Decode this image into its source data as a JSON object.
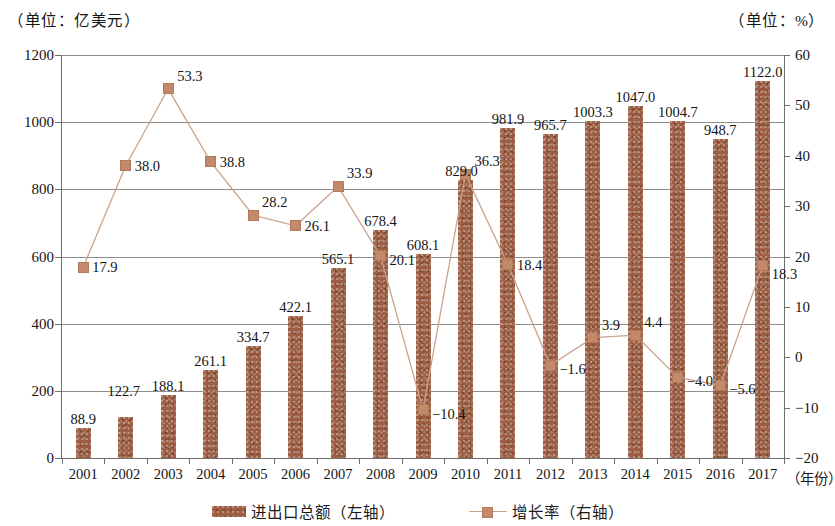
{
  "header": {
    "unit_left": "（单位：亿美元）",
    "unit_right": "（单位：%）"
  },
  "axes": {
    "x_axis_title": "（年份）",
    "y_left_ticks": [
      "0",
      "200",
      "400",
      "600",
      "800",
      "1000",
      "1200"
    ],
    "y_right_ticks": [
      "-20",
      "-10",
      "0",
      "10",
      "20",
      "30",
      "40",
      "50",
      "60"
    ]
  },
  "legend": {
    "bar_label": "进出口总额（左轴）",
    "line_label": "增长率（右轴）"
  },
  "colors": {
    "bar": "#9d5f43",
    "line": "#c9a38c",
    "marker": "#c4886a",
    "grid": "#8d8d8d",
    "axis": "#6e6e6e",
    "text": "#141414",
    "background": "#ffffff"
  },
  "chart_data": {
    "type": "bar",
    "title": "",
    "subtitle": "",
    "xlabel": "（年份）",
    "ylabel": "（单位：亿美元）",
    "y2label": "（单位：%）",
    "ylim": [
      0,
      1200
    ],
    "y2lim": [
      -20,
      60
    ],
    "grid": true,
    "legend_position": "bottom",
    "categories": [
      "2001",
      "2002",
      "2003",
      "2004",
      "2005",
      "2006",
      "2007",
      "2008",
      "2009",
      "2010",
      "2011",
      "2012",
      "2013",
      "2014",
      "2015",
      "2016",
      "2017"
    ],
    "series": [
      {
        "name": "进出口总额（左轴）",
        "type": "bar",
        "axis": "left",
        "unit": "亿美元",
        "values": [
          88.9,
          122.7,
          188.1,
          261.1,
          334.7,
          422.1,
          565.1,
          678.4,
          608.1,
          829.0,
          981.9,
          965.7,
          1003.3,
          1047.0,
          1004.7,
          948.7,
          1122.0
        ],
        "labels": [
          "88.9",
          "122.7",
          "188.1",
          "261.1",
          "334.7",
          "422.1",
          "565.1",
          "678.4",
          "608.1",
          "829.0",
          "981.9",
          "965.7",
          "1003.3",
          "1047.0",
          "1004.7",
          "948.7",
          "1122.0"
        ]
      },
      {
        "name": "增长率（右轴）",
        "type": "line",
        "axis": "right",
        "unit": "%",
        "values": [
          17.9,
          38.0,
          53.3,
          38.8,
          28.2,
          26.1,
          33.9,
          20.1,
          -10.4,
          36.3,
          18.4,
          -1.6,
          3.9,
          4.4,
          -4.0,
          -5.6,
          18.3
        ],
        "labels": [
          "17.9",
          "38.0",
          "53.3",
          "38.8",
          "28.2",
          "26.1",
          "33.9",
          "20.1",
          "-10.4",
          "36.3",
          "18.4",
          "-1.6",
          "3.9",
          "4.4",
          "-4.0",
          "-5.6",
          "18.3"
        ]
      }
    ]
  }
}
